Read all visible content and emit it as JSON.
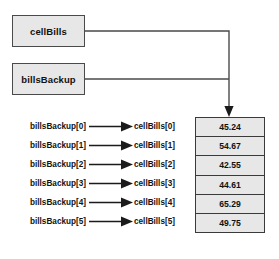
{
  "diagram": {
    "background_color": "#ffffff",
    "box_fill_color": "#e7e7e7",
    "border_color": "#3a3a3a",
    "line_color": "#4a4a4a",
    "reference_boxes": [
      {
        "label": "cellBills",
        "name": "cellbills-reference-box"
      },
      {
        "label": "billsBackup",
        "name": "billsbackup-reference-box"
      }
    ],
    "rows": [
      {
        "source": "billsBackup[0]",
        "target": "cellBills[0]",
        "value": "45.24"
      },
      {
        "source": "billsBackup[1]",
        "target": "cellBills[1]",
        "value": "54.67"
      },
      {
        "source": "billsBackup[2]",
        "target": "cellBills[2]",
        "value": "42.55"
      },
      {
        "source": "billsBackup[3]",
        "target": "cellBills[3]",
        "value": "44.61"
      },
      {
        "source": "billsBackup[4]",
        "target": "cellBills[4]",
        "value": "65.29"
      },
      {
        "source": "billsBackup[5]",
        "target": "cellBills[5]",
        "value": "49.75"
      }
    ],
    "array_values": [
      "45.24",
      "54.67",
      "42.55",
      "44.61",
      "65.29",
      "49.75"
    ],
    "icons": {
      "row_arrow": "arrow-right-icon",
      "pointer_arrow": "arrow-down-icon"
    }
  }
}
